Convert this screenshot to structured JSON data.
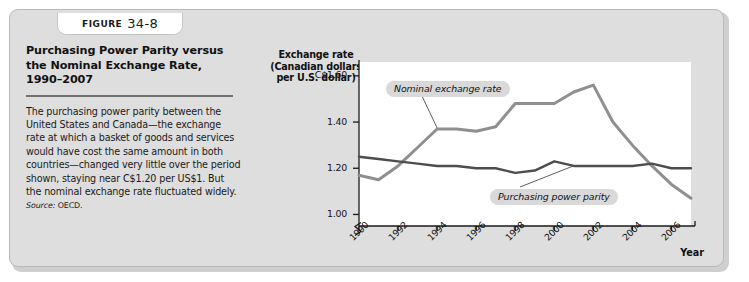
{
  "figure": {
    "tab_word": "FIGURE",
    "tab_number": "34-8",
    "title": "Purchasing Power Parity versus the Nominal Exchange Rate, 1990–2007",
    "body": "The purchasing power parity between the United States and Canada—the exchange rate at which a basket of goods and services would have cost the same amount in both countries—changed very little over the period shown, staying near C$1.20 per US$1. But the nominal exchange rate fluctuated widely.",
    "source_label": "Source:",
    "source_value": "OECD."
  },
  "colors": {
    "panel_bg": "#dedede",
    "plot_bg": "#ffffff",
    "nominal_line": "#8f8f8f",
    "ppp_line": "#4d4d4d",
    "axis": "#1a1a1a",
    "label_chip": "#d9d9d9",
    "rule": "#6f6f6f"
  },
  "chart_data": {
    "type": "line",
    "title": "Purchasing Power Parity versus the Nominal Exchange Rate, 1990–2007",
    "ylabel": "Exchange rate (Canadian dollars per U.S. dollar)",
    "ylabel_lines": [
      "Exchange rate",
      "(Canadian dollars",
      "per U.S. dollar)"
    ],
    "xlabel": "Year",
    "ytick_labels": [
      "C$1.60",
      "1.40",
      "1.20",
      "1.00"
    ],
    "ytick_values": [
      1.6,
      1.4,
      1.2,
      1.0
    ],
    "xtick_labels": [
      "1990",
      "1992",
      "1994",
      "1996",
      "1998",
      "2000",
      "2002",
      "2004",
      "2006"
    ],
    "xtick_values": [
      1990,
      1992,
      1994,
      1996,
      1998,
      2000,
      2002,
      2004,
      2006
    ],
    "ylim": [
      0.95,
      1.66
    ],
    "xlim": [
      1990,
      2007
    ],
    "axis_break": true,
    "grid": false,
    "legend_position": "inline-annotations",
    "x": [
      1990,
      1991,
      1992,
      1993,
      1994,
      1995,
      1996,
      1997,
      1998,
      1999,
      2000,
      2001,
      2002,
      2003,
      2004,
      2005,
      2006,
      2007
    ],
    "series": [
      {
        "name": "Nominal exchange rate",
        "color": "#8f8f8f",
        "values": [
          1.17,
          1.15,
          1.21,
          1.29,
          1.37,
          1.37,
          1.36,
          1.38,
          1.48,
          1.48,
          1.48,
          1.53,
          1.56,
          1.4,
          1.3,
          1.21,
          1.13,
          1.07
        ]
      },
      {
        "name": "Purchasing power parity",
        "color": "#4d4d4d",
        "values": [
          1.25,
          1.24,
          1.23,
          1.22,
          1.21,
          1.21,
          1.2,
          1.2,
          1.18,
          1.19,
          1.23,
          1.21,
          1.21,
          1.21,
          1.21,
          1.22,
          1.2,
          1.2
        ]
      }
    ],
    "annotations": [
      {
        "text": "Nominal exchange rate",
        "points_to_year": 1994
      },
      {
        "text": "Purchasing power parity",
        "points_to_year": 2001
      }
    ]
  }
}
